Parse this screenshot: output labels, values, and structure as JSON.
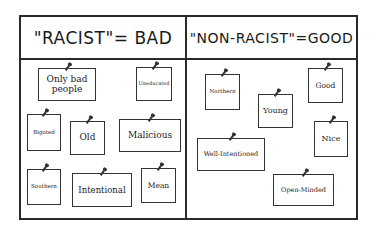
{
  "comic": {
    "left_column": {
      "title": "\"RACIST\"= BAD",
      "notes": [
        {
          "text": "Only bad people",
          "x": 38,
          "y": 68,
          "w": 58,
          "h": 33,
          "size": 9
        },
        {
          "text": "Uneducated",
          "x": 136,
          "y": 67,
          "w": 36,
          "h": 34,
          "size": 5
        },
        {
          "text": "Bigoted",
          "x": 27,
          "y": 114,
          "w": 34,
          "h": 37,
          "size": 5.5
        },
        {
          "text": "Old",
          "x": 70,
          "y": 121,
          "w": 35,
          "h": 34,
          "size": 9
        },
        {
          "text": "Malicious",
          "x": 119,
          "y": 119,
          "w": 62,
          "h": 33,
          "size": 9
        },
        {
          "text": "Southern",
          "x": 27,
          "y": 169,
          "w": 34,
          "h": 36,
          "size": 5.5
        },
        {
          "text": "Intentional",
          "x": 72,
          "y": 173,
          "w": 60,
          "h": 34,
          "size": 8.5
        },
        {
          "text": "Mean",
          "x": 141,
          "y": 168,
          "w": 35,
          "h": 35,
          "size": 7.5
        }
      ]
    },
    "right_column": {
      "title": "\"NON-RACIST\"=GOOD",
      "notes": [
        {
          "text": "Northern",
          "x": 205,
          "y": 74,
          "w": 35,
          "h": 36,
          "size": 5.5
        },
        {
          "text": "Young",
          "x": 258,
          "y": 94,
          "w": 35,
          "h": 34,
          "size": 8
        },
        {
          "text": "Good",
          "x": 308,
          "y": 68,
          "w": 35,
          "h": 35,
          "size": 7.5
        },
        {
          "text": "Nice",
          "x": 314,
          "y": 121,
          "w": 34,
          "h": 36,
          "size": 8
        },
        {
          "text": "Well-Intentioned",
          "x": 197,
          "y": 138,
          "w": 68,
          "h": 33,
          "size": 6.5
        },
        {
          "text": "Open-Minded",
          "x": 273,
          "y": 174,
          "w": 61,
          "h": 32,
          "size": 6.5
        }
      ]
    }
  }
}
